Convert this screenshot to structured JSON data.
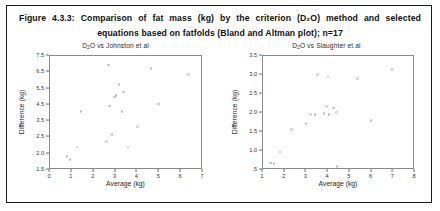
{
  "figure": {
    "caption_line1": "Figure 4.3.3: Comparison of fat mass (kg) by the criterion (D₂O) method and selected",
    "caption_line2": "equations based on fatfolds (Bland and Altman plot); n=17",
    "sample_size": "n=17"
  },
  "chart_data": [
    {
      "type": "scatter",
      "title": "D′2O vs Johnston et al",
      "title_prefix": "D",
      "title_sub": "2",
      "title_suffix": "O vs Johnston et al",
      "xlabel": "Average (kg)",
      "ylabel": "Difference (kg)",
      "xlim": [
        0,
        7
      ],
      "ylim": [
        1.5,
        7.5
      ],
      "xticks": [
        0,
        1,
        2,
        3,
        4,
        5,
        6,
        7
      ],
      "xticklabels": [
        "0",
        "1",
        "2",
        "3",
        "4",
        "5",
        "6",
        "7"
      ],
      "yticks": [
        1.5,
        2.0,
        2.5,
        3.5,
        4.5,
        5.5,
        6.5,
        7.5
      ],
      "yticklabels": [
        "1.5",
        "2.0",
        "2.5",
        "3.5",
        "4.5",
        "5.5",
        "6.5",
        "7.5"
      ],
      "grid": false,
      "legend": "none",
      "marker_color": "#b9b9bd",
      "points": [
        {
          "x": 0.82,
          "y": 1.88
        },
        {
          "x": 0.97,
          "y": 1.8
        },
        {
          "x": 1.28,
          "y": 2.18
        },
        {
          "x": 1.47,
          "y": 4.02
        },
        {
          "x": 2.62,
          "y": 2.34
        },
        {
          "x": 2.72,
          "y": 6.88
        },
        {
          "x": 2.77,
          "y": 4.36
        },
        {
          "x": 2.88,
          "y": 2.62
        },
        {
          "x": 3.0,
          "y": 4.92
        },
        {
          "x": 3.06,
          "y": 5.02
        },
        {
          "x": 3.2,
          "y": 5.7
        },
        {
          "x": 3.34,
          "y": 4.04
        },
        {
          "x": 3.4,
          "y": 5.22
        },
        {
          "x": 3.62,
          "y": 2.18
        },
        {
          "x": 4.05,
          "y": 3.1
        },
        {
          "x": 4.66,
          "y": 6.68
        },
        {
          "x": 5.02,
          "y": 4.5
        },
        {
          "x": 6.38,
          "y": 6.3
        }
      ]
    },
    {
      "type": "scatter",
      "title": "D′2O vs Slaughter et al",
      "title_prefix": "D",
      "title_sub": "2",
      "title_suffix": "O vs Slaughter et al",
      "xlabel": "Average (kg)",
      "ylabel": "Difference (kg)",
      "xlim": [
        1,
        8
      ],
      "ylim": [
        0.5,
        3.5
      ],
      "xticks": [
        1,
        2,
        3,
        4,
        5,
        6,
        7,
        8
      ],
      "xticklabels": [
        "1",
        "2",
        "3",
        "4",
        "5",
        "6",
        "7",
        "8"
      ],
      "yticks": [
        0.5,
        1.0,
        1.5,
        2.0,
        2.5,
        3.0,
        3.5
      ],
      "yticklabels": [
        ".5",
        "1.0",
        "1.5",
        "2.0",
        "2.5",
        "3.0",
        "3.5"
      ],
      "grid": false,
      "legend": "none",
      "marker_color": "#b9b9bd",
      "points": [
        {
          "x": 1.4,
          "y": 0.66
        },
        {
          "x": 1.55,
          "y": 0.64
        },
        {
          "x": 1.82,
          "y": 0.95
        },
        {
          "x": 2.36,
          "y": 1.54
        },
        {
          "x": 3.02,
          "y": 1.7
        },
        {
          "x": 3.22,
          "y": 1.93
        },
        {
          "x": 3.45,
          "y": 1.94
        },
        {
          "x": 3.56,
          "y": 2.98
        },
        {
          "x": 3.86,
          "y": 1.96
        },
        {
          "x": 3.96,
          "y": 2.15
        },
        {
          "x": 4.04,
          "y": 2.92
        },
        {
          "x": 4.08,
          "y": 1.94
        },
        {
          "x": 4.3,
          "y": 2.1
        },
        {
          "x": 4.42,
          "y": 1.99
        },
        {
          "x": 4.46,
          "y": 0.56
        },
        {
          "x": 5.4,
          "y": 2.88
        },
        {
          "x": 6.02,
          "y": 1.78
        },
        {
          "x": 6.98,
          "y": 3.12
        }
      ]
    }
  ]
}
